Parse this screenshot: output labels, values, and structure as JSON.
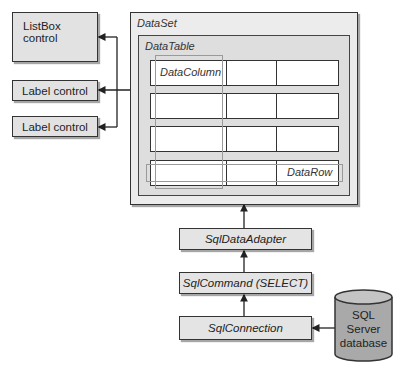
{
  "controls": {
    "listbox": "ListBox control",
    "label1": "Label control",
    "label2": "Label control"
  },
  "dataset": {
    "title": "DataSet",
    "datatable": {
      "title": "DataTable",
      "column_label": "DataColumn",
      "row_label": "DataRow",
      "rows": 4,
      "columns": 3
    }
  },
  "pipeline": {
    "adapter": "SqlDataAdapter",
    "command": "SqlCommand (SELECT)",
    "connection": "SqlConnection"
  },
  "database": {
    "line1": "SQL",
    "line2": "Server",
    "line3": "database"
  },
  "colors": {
    "box_fill": "#e2e2e2",
    "database_fill": "#a8a8a8",
    "stroke": "#333333"
  }
}
